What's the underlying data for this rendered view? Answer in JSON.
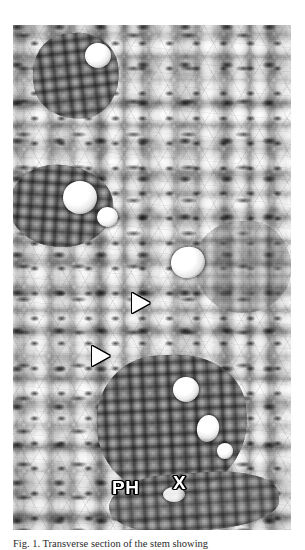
{
  "figure": {
    "type": "light-micrograph",
    "modality": "grayscale transverse section",
    "caption": "Fig. 1. Transverse section of the stem showing"
  },
  "annotations": {
    "xylem": {
      "label": "X",
      "name": "xylem",
      "color": "#ffffff",
      "outline": "#000000"
    },
    "phloem": {
      "label": "PH",
      "name": "phloem",
      "color": "#ffffff",
      "outline": "#000000"
    },
    "arrowheads": [
      {
        "name": "arrowhead-upper",
        "fill": "#ffffff",
        "outline": "#000000",
        "direction": "right"
      },
      {
        "name": "arrowhead-lower",
        "fill": "#ffffff",
        "outline": "#000000",
        "direction": "right"
      }
    ]
  },
  "scalebar": {
    "value": "25",
    "unit": "µm",
    "label": "25 µm",
    "bar_color": "#000000",
    "bar_length_px": 43
  },
  "colors": {
    "background": "#ffffff",
    "tissue_light": "#e8e8e8",
    "tissue_mid": "#bdbdbd",
    "tissue_dark": "#3c3c3c",
    "annotation": "#ffffff",
    "annotation_outline": "#000000"
  }
}
